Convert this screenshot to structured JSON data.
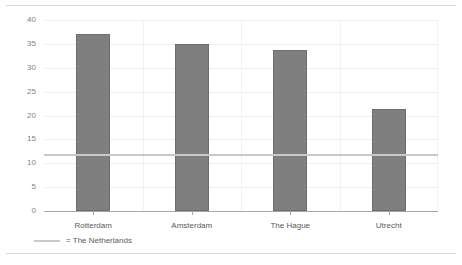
{
  "chart_data": {
    "type": "bar",
    "title": "",
    "subtitle": "",
    "xlabel": "",
    "ylabel": "",
    "categories": [
      "Rotterdam",
      "Amsterdam",
      "The Hague",
      "Utrecht"
    ],
    "values": [
      37,
      35,
      33.7,
      21.3
    ],
    "series": [
      {
        "name": "City",
        "values": [
          37,
          35,
          33.7,
          21.3
        ]
      }
    ],
    "reference_line": {
      "label": "= The Netherlands",
      "value": 11.7,
      "color": "#c9c9c9"
    },
    "ylim": [
      0,
      40
    ],
    "ytick_labels": [
      "40",
      "35",
      "30",
      "25",
      "20",
      "15",
      "10",
      "5",
      "0"
    ],
    "ytick_values": [
      40,
      35,
      30,
      25,
      20,
      15,
      10,
      5,
      0
    ],
    "grid": true,
    "legend_position": "bottom-left",
    "bar_color": "#7f7f7f",
    "bar_border_color": "#6e6e6e",
    "gridline_color": "#f0f0f0",
    "axis_color": "#a6a6a6",
    "text_color": "#5a5a5a"
  },
  "legend": {
    "marker_name": "reference-line-marker",
    "text": "= The Netherlands"
  },
  "rules": {
    "top": "divider",
    "bottom": "divider"
  }
}
